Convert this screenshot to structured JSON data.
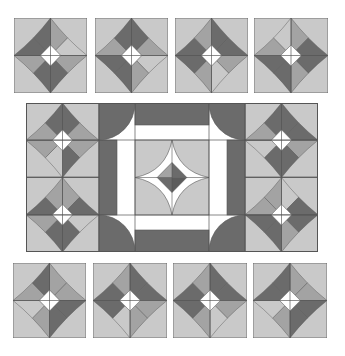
{
  "colors": {
    "background": "#ffffff",
    "light": "#c9c9c9",
    "medium": "#a3a3a3",
    "dark": "#6b6b6b",
    "darker": "#5c5c5c",
    "white": "#ffffff",
    "line": "#555555"
  },
  "top_row": [
    {
      "id": "top-1",
      "x": 14,
      "y": 18,
      "w": 73,
      "h": 75,
      "petals": [
        "dark",
        "medium",
        "light",
        "medium",
        "dark",
        "dark",
        "medium",
        "dark"
      ]
    },
    {
      "id": "top-2",
      "x": 95,
      "y": 18,
      "w": 73,
      "h": 75,
      "petals": [
        "dark",
        "dark",
        "medium",
        "light",
        "medium",
        "dark",
        "dark",
        "medium"
      ]
    },
    {
      "id": "top-3",
      "x": 175,
      "y": 18,
      "w": 73,
      "h": 75,
      "petals": [
        "medium",
        "dark",
        "dark",
        "medium",
        "light",
        "medium",
        "dark",
        "dark"
      ]
    },
    {
      "id": "top-4",
      "x": 254,
      "y": 18,
      "w": 74,
      "h": 75,
      "petals": [
        "light",
        "medium",
        "dark",
        "dark",
        "medium",
        "dark",
        "dark",
        "medium"
      ]
    }
  ],
  "bottom_row": [
    {
      "id": "bottom-1",
      "x": 13,
      "y": 263,
      "w": 73,
      "h": 75,
      "petals": [
        "dark",
        "medium",
        "medium",
        "dark",
        "dark",
        "medium",
        "light",
        "medium"
      ]
    },
    {
      "id": "bottom-2",
      "x": 93,
      "y": 263,
      "w": 74,
      "h": 75,
      "petals": [
        "medium",
        "dark",
        "dark",
        "medium",
        "medium",
        "light",
        "dark",
        "dark"
      ]
    },
    {
      "id": "bottom-3",
      "x": 173,
      "y": 263,
      "w": 74,
      "h": 75,
      "petals": [
        "medium",
        "dark",
        "dark",
        "medium",
        "light",
        "medium",
        "dark",
        "dark"
      ]
    },
    {
      "id": "bottom-4",
      "x": 253,
      "y": 263,
      "w": 74,
      "h": 75,
      "petals": [
        "dark",
        "medium",
        "medium",
        "dark",
        "dark",
        "medium",
        "light",
        "dark"
      ]
    }
  ],
  "middle_block": {
    "x": 26,
    "y": 103,
    "w": 292,
    "h": 149,
    "side_stars": [
      {
        "id": "left-upper",
        "col": "left",
        "row": 0,
        "petals": [
          "dark",
          "dark",
          "medium",
          "medium",
          "dark",
          "light",
          "medium",
          "medium"
        ]
      },
      {
        "id": "left-lower",
        "col": "left",
        "row": 1,
        "petals": [
          "medium",
          "medium",
          "dark",
          "light",
          "dark",
          "dark",
          "medium",
          "dark"
        ]
      },
      {
        "id": "right-upper",
        "col": "right",
        "row": 0,
        "petals": [
          "dark",
          "dark",
          "dark",
          "medium",
          "dark",
          "dark",
          "light",
          "medium"
        ]
      },
      {
        "id": "right-lower",
        "col": "right",
        "row": 1,
        "petals": [
          "medium",
          "light",
          "dark",
          "dark",
          "medium",
          "dark",
          "dark",
          "medium"
        ]
      }
    ],
    "center_star": {
      "diamond_quadrants": [
        "medium",
        "dark",
        "dark",
        "darker"
      ]
    }
  }
}
